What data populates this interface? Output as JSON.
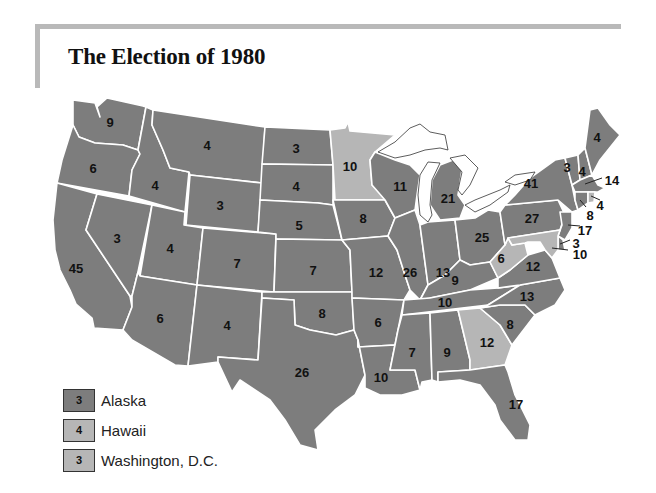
{
  "title": "The Election of 1980",
  "colors": {
    "reagan": "#7d7d7d",
    "carter": "#b6b6b6",
    "frame": "#b9b9b9",
    "border": "#ffffff"
  },
  "states": [
    {
      "id": "WA",
      "votes": "9",
      "party": "reagan"
    },
    {
      "id": "OR",
      "votes": "6",
      "party": "reagan"
    },
    {
      "id": "CA",
      "votes": "45",
      "party": "reagan"
    },
    {
      "id": "ID",
      "votes": "4",
      "party": "reagan"
    },
    {
      "id": "NV",
      "votes": "3",
      "party": "reagan"
    },
    {
      "id": "MT",
      "votes": "4",
      "party": "reagan"
    },
    {
      "id": "WY",
      "votes": "3",
      "party": "reagan"
    },
    {
      "id": "UT",
      "votes": "4",
      "party": "reagan"
    },
    {
      "id": "AZ",
      "votes": "6",
      "party": "reagan"
    },
    {
      "id": "CO",
      "votes": "7",
      "party": "reagan"
    },
    {
      "id": "NM",
      "votes": "4",
      "party": "reagan"
    },
    {
      "id": "ND",
      "votes": "3",
      "party": "reagan"
    },
    {
      "id": "SD",
      "votes": "4",
      "party": "reagan"
    },
    {
      "id": "NE",
      "votes": "5",
      "party": "reagan"
    },
    {
      "id": "KS",
      "votes": "7",
      "party": "reagan"
    },
    {
      "id": "OK",
      "votes": "8",
      "party": "reagan"
    },
    {
      "id": "TX",
      "votes": "26",
      "party": "reagan"
    },
    {
      "id": "MN",
      "votes": "10",
      "party": "carter"
    },
    {
      "id": "IA",
      "votes": "8",
      "party": "reagan"
    },
    {
      "id": "MO",
      "votes": "12",
      "party": "reagan"
    },
    {
      "id": "AR",
      "votes": "6",
      "party": "reagan"
    },
    {
      "id": "LA",
      "votes": "10",
      "party": "reagan"
    },
    {
      "id": "WI",
      "votes": "11",
      "party": "reagan"
    },
    {
      "id": "IL",
      "votes": "26",
      "party": "reagan"
    },
    {
      "id": "MI",
      "votes": "21",
      "party": "reagan"
    },
    {
      "id": "IN",
      "votes": "13",
      "party": "reagan"
    },
    {
      "id": "OH",
      "votes": "25",
      "party": "reagan"
    },
    {
      "id": "KY",
      "votes": "9",
      "party": "reagan"
    },
    {
      "id": "TN",
      "votes": "10",
      "party": "reagan"
    },
    {
      "id": "MS",
      "votes": "7",
      "party": "reagan"
    },
    {
      "id": "AL",
      "votes": "9",
      "party": "reagan"
    },
    {
      "id": "GA",
      "votes": "12",
      "party": "carter"
    },
    {
      "id": "FL",
      "votes": "17",
      "party": "reagan"
    },
    {
      "id": "SC",
      "votes": "8",
      "party": "reagan"
    },
    {
      "id": "NC",
      "votes": "13",
      "party": "reagan"
    },
    {
      "id": "VA",
      "votes": "12",
      "party": "reagan"
    },
    {
      "id": "WV",
      "votes": "6",
      "party": "carter"
    },
    {
      "id": "PA",
      "votes": "27",
      "party": "reagan"
    },
    {
      "id": "NY",
      "votes": "41",
      "party": "reagan"
    },
    {
      "id": "VT",
      "votes": "3",
      "party": "reagan"
    },
    {
      "id": "NH",
      "votes": "4",
      "party": "reagan"
    },
    {
      "id": "ME",
      "votes": "4",
      "party": "reagan"
    },
    {
      "id": "MA",
      "votes": "14",
      "party": "reagan"
    },
    {
      "id": "RI",
      "votes": "4",
      "party": "carter"
    },
    {
      "id": "CT",
      "votes": "8",
      "party": "reagan"
    },
    {
      "id": "NJ",
      "votes": "17",
      "party": "reagan"
    },
    {
      "id": "DE",
      "votes": "3",
      "party": "reagan"
    },
    {
      "id": "MD",
      "votes": "10",
      "party": "carter"
    }
  ],
  "legend": [
    {
      "label": "Alaska",
      "votes": "3",
      "party": "reagan"
    },
    {
      "label": "Hawaii",
      "votes": "4",
      "party": "carter"
    },
    {
      "label": "Washington, D.C.",
      "votes": "3",
      "party": "carter"
    }
  ]
}
